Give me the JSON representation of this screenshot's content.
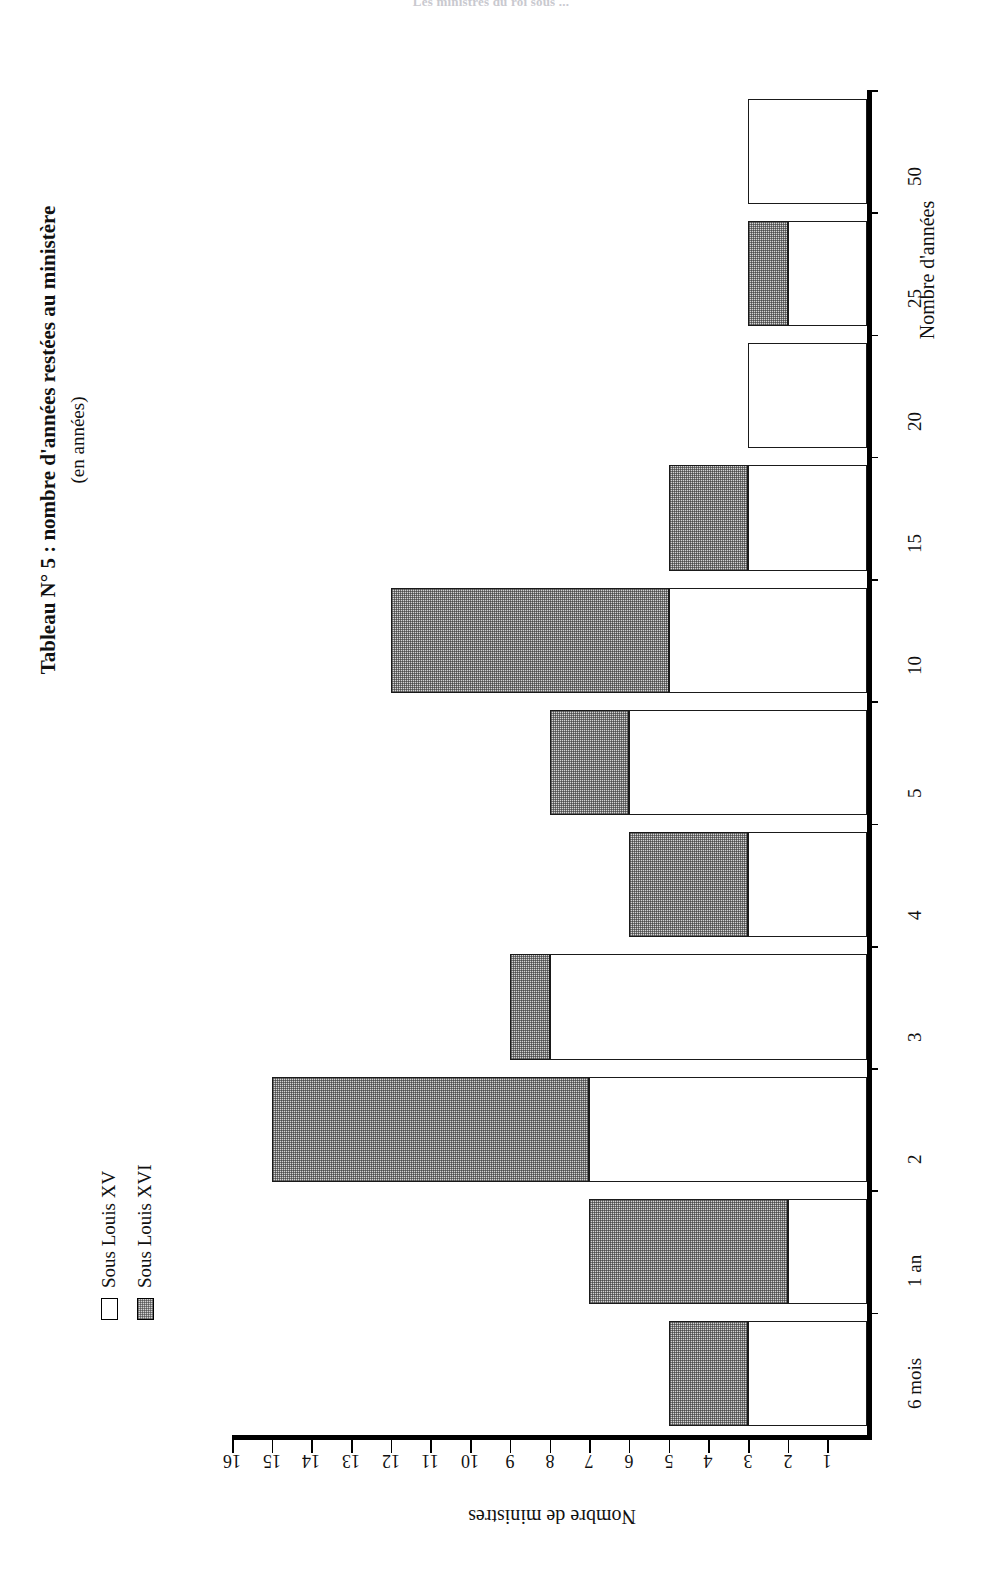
{
  "running_header": "Les ministres du roi sous ...",
  "title": {
    "main": "Tableau N° 5 : nombre d'années restées au ministère",
    "subtitle": "(en années)"
  },
  "legend": {
    "items": [
      {
        "label": "Sous Louis XV",
        "swatch": "white-square-icon",
        "color": "#ffffff"
      },
      {
        "label": "Sous Louis XVI",
        "swatch": "gray-hatched-square-icon",
        "color": "#d4d4d4"
      }
    ]
  },
  "chart_data": {
    "type": "bar",
    "orientation": "horizontal-rotated-180",
    "title": "Tableau N° 5 : nombre d'années restées au ministère",
    "subtitle": "(en années)",
    "xlabel": "Nombre d'années",
    "ylabel": "Nombre de ministres",
    "categories": [
      "6 mois",
      "1 an",
      "2",
      "3",
      "4",
      "5",
      "10",
      "15",
      "20",
      "25",
      "50"
    ],
    "series": [
      {
        "name": "Sous Louis XV",
        "values": [
          3,
          2,
          7,
          8,
          3,
          6,
          5,
          3,
          3,
          2,
          3
        ]
      },
      {
        "name": "Sous Louis XVI",
        "values": [
          2,
          5,
          8,
          1,
          3,
          2,
          7,
          2,
          0,
          1,
          0
        ]
      }
    ],
    "totals": [
      5,
      7,
      15,
      9,
      6,
      8,
      12,
      5,
      3,
      3,
      3
    ],
    "stacked": true,
    "value_axis_ticks": [
      1,
      2,
      3,
      4,
      5,
      6,
      7,
      8,
      9,
      10,
      11,
      12,
      13,
      14,
      15,
      16
    ],
    "value_axis_tick_labels": [
      "1",
      "2",
      "3",
      "4",
      "5",
      "6",
      "7",
      "8",
      "9",
      "10",
      "11",
      "12",
      "13",
      "14",
      "15",
      "16"
    ],
    "ylim": [
      0,
      16
    ],
    "grid": false,
    "legend_position": "left"
  }
}
